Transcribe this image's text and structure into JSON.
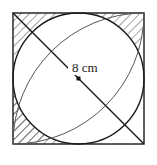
{
  "figure": {
    "labels": {
      "diagonal_measure": "8 cm"
    },
    "geometry": {
      "square": {
        "x": 13,
        "y": 13,
        "size": 131
      },
      "circle": {
        "cx": 78.5,
        "cy": 78.5,
        "r": 65.5
      },
      "center_dot": {
        "cx": 78.5,
        "cy": 78.5,
        "size": 4
      },
      "diagonal": {
        "x1": 13,
        "y1": 13,
        "x2": 144,
        "y2": 144
      },
      "arc_top_left": {
        "cx": 13,
        "cy": 13,
        "r": 131
      },
      "arc_bottom_right": {
        "cx": 144,
        "cy": 144,
        "r": 131
      },
      "label_position": {
        "x": 72,
        "y": 72
      }
    },
    "colors": {
      "stroke": "#1a1a1a",
      "thin_stroke": "#55565a",
      "hatch": "#33343a",
      "background": "#ffffff"
    },
    "shaded_regions": [
      "top-left-lune",
      "bottom-left-corner",
      "bottom-right-corner"
    ]
  }
}
